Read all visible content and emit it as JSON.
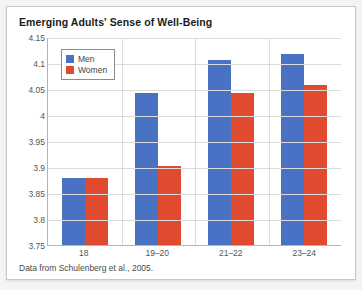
{
  "card": {
    "title": "Emerging Adults' Sense of Well-Being",
    "caption": "Data from Schulenberg et al., 2005."
  },
  "colors": {
    "men": "#4a72c4",
    "women": "#e04a2f",
    "grid": "#dcdcdc",
    "axis": "#b4b4b4",
    "card_background": "#ffffff",
    "page_background": "#f4f4f4",
    "title_text": "#1b1b1b",
    "tick_text": "#555555"
  },
  "legend": {
    "entries": [
      {
        "label": "Men",
        "color": "#4a72c4"
      },
      {
        "label": "Women",
        "color": "#e04a2f"
      }
    ]
  },
  "axes": {
    "y_ticks": [
      "4.15",
      "4.1",
      "4.05",
      "4",
      "3.95",
      "3.9",
      "3.85",
      "3.8",
      "3.75"
    ],
    "x_ticks": [
      "18",
      "19–20",
      "21–22",
      "23–24"
    ]
  },
  "chart_data": {
    "type": "bar",
    "title": "Emerging Adults' Sense of Well-Being",
    "subtitle": "",
    "xlabel": "",
    "ylabel": "",
    "ylim": [
      3.75,
      4.15
    ],
    "ytick_step": 0.05,
    "grid": true,
    "legend_position": "inside-top-left",
    "annotations": [
      "Data from Schulenberg et al., 2005."
    ],
    "categories": [
      "18",
      "19–20",
      "21–22",
      "23–24"
    ],
    "series": [
      {
        "name": "Men",
        "color": "#4a72c4",
        "values": [
          3.878,
          4.042,
          4.105,
          4.118
        ]
      },
      {
        "name": "Women",
        "color": "#e04a2f",
        "values": [
          3.878,
          3.901,
          4.042,
          4.058
        ]
      }
    ]
  }
}
